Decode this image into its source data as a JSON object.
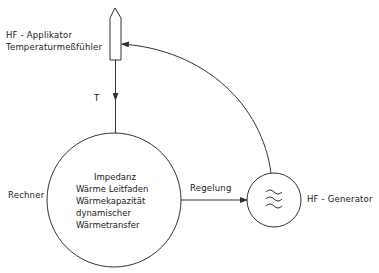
{
  "diagram": {
    "nodes": {
      "probe": {
        "label_line1": "HF - Applikator",
        "label_line2": "Temperaturmeßfühler"
      },
      "computer": {
        "label": "Rechner",
        "contents": [
          "Impedanz",
          "Wärme Leitfaden",
          "Wärmekapazität",
          "dynamischer",
          "Wärmetransfer"
        ]
      },
      "generator": {
        "label": "HF - Generator",
        "symbol": "triple-wave-icon"
      }
    },
    "edges": [
      {
        "from": "probe",
        "to": "computer",
        "label": "T"
      },
      {
        "from": "computer",
        "to": "generator",
        "label": "Regelung"
      },
      {
        "from": "generator",
        "to": "probe",
        "label": ""
      }
    ],
    "colors": {
      "line": "#333333",
      "background": "#ffffff"
    }
  }
}
